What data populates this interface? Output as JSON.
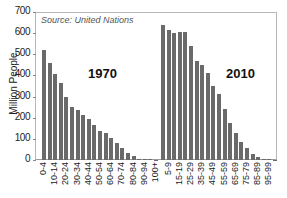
{
  "chart_data": {
    "type": "bar",
    "title": "",
    "source": "Source: United Nations",
    "xlabel": "",
    "ylabel": "Million People",
    "ylim": [
      0,
      700
    ],
    "yticks": [
      0,
      100,
      200,
      300,
      400,
      500,
      600,
      700
    ],
    "grid": false,
    "legend": null,
    "categories": [
      "0-4",
      "5-9",
      "10-14",
      "15-19",
      "20-24",
      "25-29",
      "30-34",
      "35-39",
      "40-44",
      "45-49",
      "50-54",
      "55-59",
      "60-64",
      "65-69",
      "70-74",
      "75-79",
      "80-84",
      "85-89",
      "90-94",
      "95-99",
      "100+"
    ],
    "series": [
      {
        "name": "1970",
        "values": [
          520,
          460,
          405,
          366,
          296,
          250,
          236,
          212,
          195,
          165,
          138,
          128,
          105,
          80,
          55,
          35,
          18,
          7,
          2,
          1,
          0
        ]
      },
      {
        "name": "2010",
        "values": [
          640,
          615,
          600,
          605,
          605,
          540,
          470,
          450,
          410,
          350,
          310,
          240,
          175,
          130,
          85,
          55,
          28,
          12,
          4,
          1,
          0
        ]
      }
    ],
    "annotations": [
      "1970",
      "2010"
    ]
  },
  "labels": {
    "source": "Source: United Nations",
    "ylabel": "Million People",
    "group1": "1970",
    "group2": "2010"
  }
}
